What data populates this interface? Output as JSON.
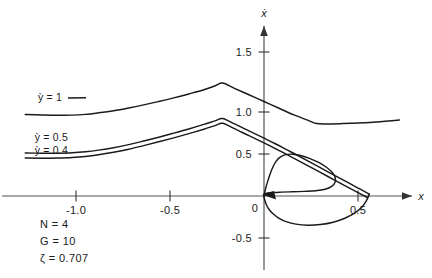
{
  "chart_data": {
    "type": "line",
    "title": "",
    "xlabel": "x",
    "ylabel": "ẋ",
    "xlim": [
      -1.28,
      0.78
    ],
    "ylim": [
      -0.72,
      1.75
    ],
    "grid": false,
    "legend": "inline-labels",
    "x_ticks": [
      {
        "value": -1.0,
        "label": "-1.0"
      },
      {
        "value": -0.5,
        "label": "-0.5"
      },
      {
        "value": 0,
        "label": "0"
      },
      {
        "value": 0.5,
        "label": "0.5"
      }
    ],
    "y_ticks": [
      {
        "value": 1.5,
        "label": "1.5"
      },
      {
        "value": 1.0,
        "label": "1.0"
      },
      {
        "value": 0.5,
        "label": "0.5"
      },
      {
        "value": 0,
        "label": "0"
      },
      {
        "value": -0.5,
        "label": "-0.5"
      }
    ],
    "series": [
      {
        "name": "ẏ = 1",
        "label": "ỳ = 1",
        "points": [
          [
            -1.27,
            0.97
          ],
          [
            -1.18,
            0.965
          ],
          [
            -1.1,
            0.962
          ],
          [
            -1.02,
            0.963
          ],
          [
            -0.95,
            0.972
          ],
          [
            -0.88,
            0.99
          ],
          [
            -0.8,
            1.015
          ],
          [
            -0.72,
            1.048
          ],
          [
            -0.64,
            1.085
          ],
          [
            -0.56,
            1.125
          ],
          [
            -0.48,
            1.168
          ],
          [
            -0.4,
            1.215
          ],
          [
            -0.32,
            1.265
          ],
          [
            -0.26,
            1.312
          ],
          [
            -0.22,
            1.345
          ],
          [
            -0.16,
            1.285
          ],
          [
            -0.08,
            1.205
          ],
          [
            0.0,
            1.125
          ],
          [
            0.08,
            1.045
          ],
          [
            0.16,
            0.965
          ],
          [
            0.24,
            0.895
          ],
          [
            0.28,
            0.862
          ],
          [
            0.34,
            0.858
          ],
          [
            0.42,
            0.862
          ],
          [
            0.5,
            0.868
          ],
          [
            0.58,
            0.878
          ],
          [
            0.66,
            0.892
          ],
          [
            0.72,
            0.905
          ]
        ]
      },
      {
        "name": "ẏ = 0.5",
        "label": "ỳ = 0.5",
        "points": [
          [
            -1.27,
            0.512
          ],
          [
            -1.18,
            0.51
          ],
          [
            -1.1,
            0.51
          ],
          [
            -1.02,
            0.515
          ],
          [
            -0.95,
            0.527
          ],
          [
            -0.88,
            0.546
          ],
          [
            -0.8,
            0.575
          ],
          [
            -0.72,
            0.612
          ],
          [
            -0.64,
            0.655
          ],
          [
            -0.56,
            0.7
          ],
          [
            -0.48,
            0.748
          ],
          [
            -0.4,
            0.798
          ],
          [
            -0.32,
            0.852
          ],
          [
            -0.26,
            0.895
          ],
          [
            -0.22,
            0.922
          ],
          [
            -0.16,
            0.862
          ],
          [
            -0.08,
            0.775
          ],
          [
            0.0,
            0.688
          ],
          [
            0.06,
            0.622
          ],
          [
            0.12,
            0.552
          ],
          [
            0.18,
            0.482
          ],
          [
            0.26,
            0.385
          ],
          [
            0.34,
            0.288
          ],
          [
            0.42,
            0.192
          ],
          [
            0.5,
            0.095
          ],
          [
            0.56,
            0.022
          ]
        ]
      },
      {
        "name": "ẏ = 0.4",
        "label": "ỳ = 0.4",
        "points": [
          [
            -1.27,
            0.452
          ],
          [
            -1.18,
            0.45
          ],
          [
            -1.1,
            0.452
          ],
          [
            -1.02,
            0.458
          ],
          [
            -0.95,
            0.47
          ],
          [
            -0.88,
            0.49
          ],
          [
            -0.8,
            0.52
          ],
          [
            -0.72,
            0.556
          ],
          [
            -0.64,
            0.6
          ],
          [
            -0.56,
            0.645
          ],
          [
            -0.48,
            0.692
          ],
          [
            -0.4,
            0.742
          ],
          [
            -0.32,
            0.795
          ],
          [
            -0.26,
            0.838
          ],
          [
            -0.22,
            0.865
          ],
          [
            -0.16,
            0.805
          ],
          [
            -0.08,
            0.718
          ],
          [
            0.0,
            0.632
          ],
          [
            0.06,
            0.565
          ],
          [
            0.12,
            0.495
          ],
          [
            0.18,
            0.425
          ],
          [
            0.26,
            0.328
          ],
          [
            0.34,
            0.232
          ],
          [
            0.42,
            0.135
          ],
          [
            0.5,
            0.04
          ],
          [
            0.55,
            -0.018
          ]
        ]
      },
      {
        "name": "spiral-trajectory",
        "label": "",
        "points": [
          [
            0.56,
            0.022
          ],
          [
            0.545,
            -0.055
          ],
          [
            0.52,
            -0.135
          ],
          [
            0.482,
            -0.205
          ],
          [
            0.43,
            -0.265
          ],
          [
            0.368,
            -0.312
          ],
          [
            0.3,
            -0.34
          ],
          [
            0.232,
            -0.348
          ],
          [
            0.17,
            -0.335
          ],
          [
            0.118,
            -0.305
          ],
          [
            0.078,
            -0.262
          ],
          [
            0.048,
            -0.212
          ],
          [
            0.026,
            -0.158
          ],
          [
            0.012,
            -0.102
          ],
          [
            0.004,
            -0.048
          ],
          [
            0.0,
            -0.005
          ],
          [
            0.005,
            0.022
          ],
          [
            0.02,
            0.036
          ],
          [
            0.048,
            0.042
          ],
          [
            0.09,
            0.046
          ],
          [
            0.15,
            0.05
          ],
          [
            0.215,
            0.055
          ],
          [
            0.275,
            0.062
          ],
          [
            0.325,
            0.08
          ],
          [
            0.36,
            0.115
          ],
          [
            0.378,
            0.165
          ],
          [
            0.378,
            0.225
          ],
          [
            0.36,
            0.288
          ],
          [
            0.328,
            0.348
          ],
          [
            0.288,
            0.402
          ],
          [
            0.242,
            0.448
          ],
          [
            0.196,
            0.482
          ],
          [
            0.152,
            0.498
          ],
          [
            0.115,
            0.492
          ],
          [
            0.086,
            0.462
          ],
          [
            0.064,
            0.412
          ],
          [
            0.048,
            0.348
          ],
          [
            0.034,
            0.272
          ],
          [
            0.022,
            0.192
          ],
          [
            0.012,
            0.118
          ],
          [
            0.005,
            0.056
          ],
          [
            0.0,
            0.012
          ],
          [
            -0.002,
            -0.01
          ]
        ]
      }
    ],
    "annotations": [
      {
        "id": "N",
        "symbol": "N",
        "value": "4",
        "text": "N = 4"
      },
      {
        "id": "G",
        "symbol": "G",
        "value": "10",
        "text": "G = 10"
      },
      {
        "id": "zeta",
        "symbol": "ζ",
        "value": "0.707",
        "text": "ζ = 0.707"
      }
    ],
    "arrows": [
      {
        "id": "x-axis-arrow",
        "direction": "right"
      },
      {
        "id": "y-axis-arrow",
        "direction": "up"
      },
      {
        "id": "trajectory-arrow",
        "direction": "left-into-origin"
      }
    ]
  },
  "labels": {
    "curve1": "ỳ = 1",
    "curve2": "ỳ = 0.5",
    "curve3": "ỳ = 0.4",
    "x_axis": "x",
    "y_axis": "ẋ",
    "param_n": "N = 4",
    "param_g": "G = 10",
    "param_zeta": "ζ = 0.707",
    "tick_xm10": "-1.0",
    "tick_xm05": "-0.5",
    "tick_x0": "0",
    "tick_x05": "0.5",
    "tick_y15": "1.5",
    "tick_y10": "1.0",
    "tick_y05": "0.5",
    "tick_ym05": "-0.5"
  },
  "colors": {
    "ink": "#1a1a1a",
    "axis": "#555555",
    "background": "#ffffff"
  }
}
